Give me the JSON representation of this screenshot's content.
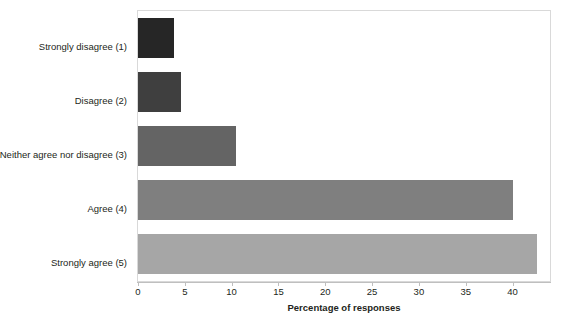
{
  "chart_data": {
    "type": "bar",
    "orientation": "horizontal",
    "title": "",
    "subtitle": "",
    "xlabel": "Percentage of responses",
    "ylabel": "",
    "categories": [
      "Strongly disagree (1)",
      "Disagree (2)",
      "Neither agree nor disagree (3)",
      "Agree (4)",
      "Strongly agree (5)"
    ],
    "values": [
      3.8,
      4.6,
      10.5,
      40.0,
      42.6
    ],
    "bar_colors": [
      "#262626",
      "#3f3f3f",
      "#646464",
      "#7f7f7f",
      "#a6a6a6"
    ],
    "xlim": [
      0,
      44
    ],
    "xticks": [
      0,
      5,
      10,
      15,
      20,
      25,
      30,
      35,
      40
    ],
    "xtick_labels": [
      "0",
      "5",
      "10",
      "15",
      "20",
      "25",
      "30",
      "35",
      "40"
    ],
    "grid": false,
    "legend": "none",
    "frame_color": "#d9d9d9",
    "axis_color": "#bfbfbf",
    "background": "#ffffff"
  }
}
